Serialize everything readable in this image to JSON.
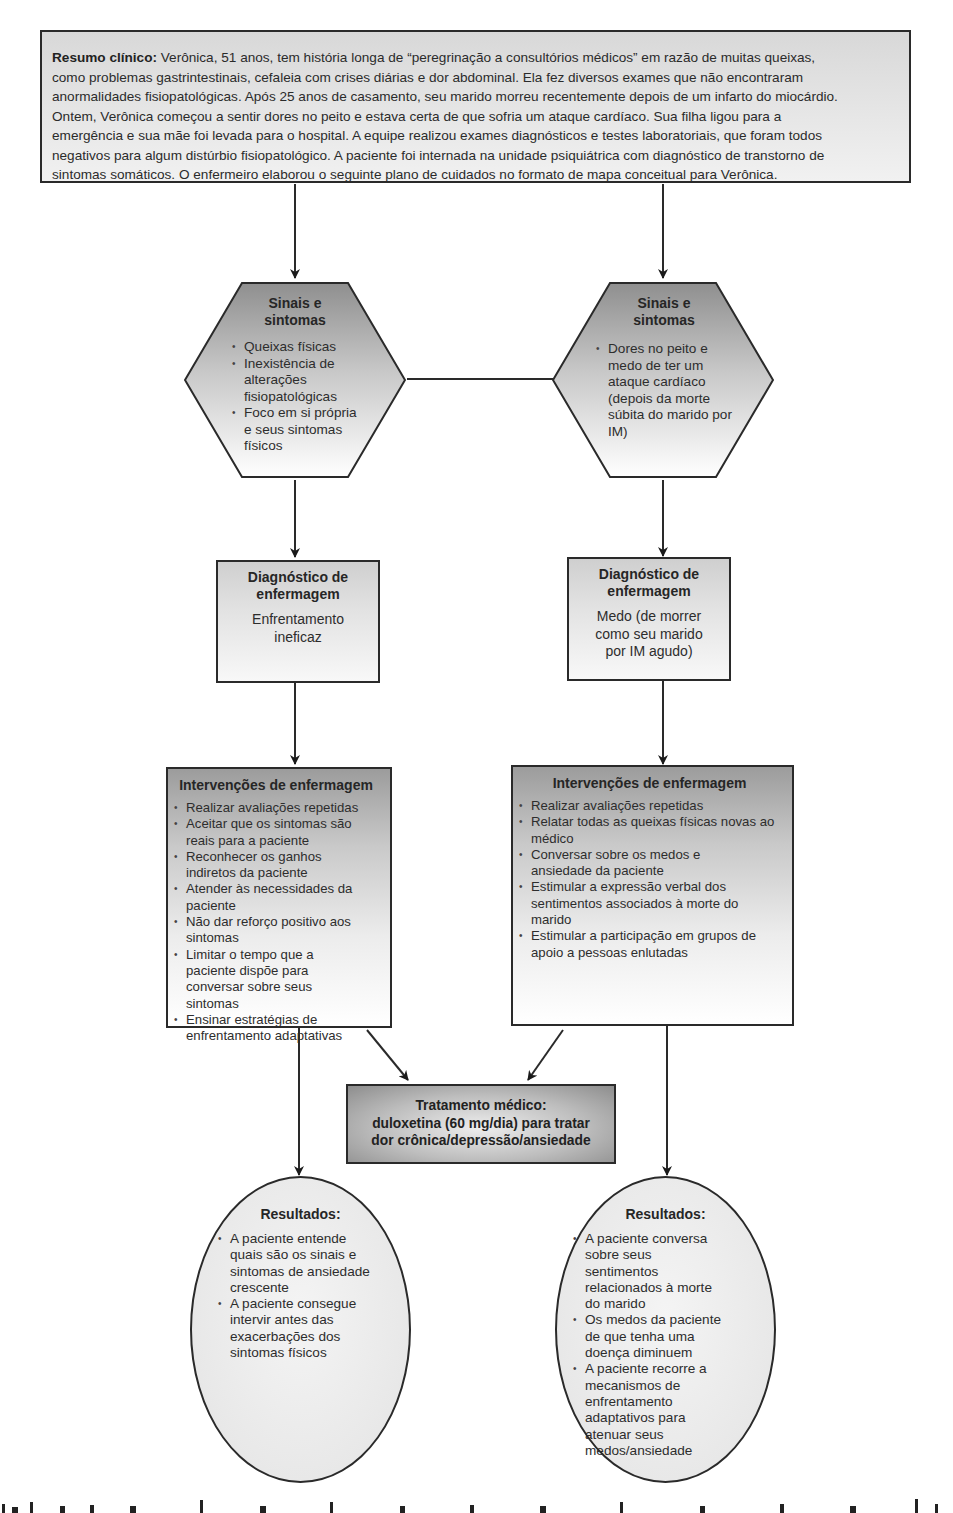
{
  "summary": {
    "label": "Resumo clínico:",
    "lines": [
      " Verônica, 51 anos, tem história longa de “peregrinação a consultórios médicos” em razão de muitas queixas,",
      "como problemas gastrintestinais, cefaleia com crises diárias e dor abdominal. Ela fez diversos exames que não encontraram",
      "anormalidades fisiopatológicas. Após 25 anos de casamento, seu marido morreu recentemente depois de um infarto do miocárdio.",
      "Ontem, Verônica começou a sentir dores no peito e estava certa de que sofria um ataque cardíaco. Sua filha ligou para a",
      "emergência e sua mãe foi levada para o hospital. A equipe realizou exames diagnósticos e testes laboratoriais, que foram todos",
      "negativos para algum distúrbio fisiopatológico. A paciente foi internada na unidade psiquiátrica com diagnóstico de transtorno de",
      "sintomas somáticos. O enfermeiro elaborou o seguinte plano de cuidados no formato de mapa conceitual para Verônica."
    ]
  },
  "left": {
    "signs": {
      "title_lines": [
        "Sinais e",
        "sintomas"
      ],
      "items": [
        "Queixas físicas",
        "Inexistência de alterações fisiopatológicas",
        "Foco em si própria e seus sintomas físicos"
      ]
    },
    "diagnosis": {
      "title_lines": [
        "Diagnóstico de",
        "enfermagem"
      ],
      "body_lines": [
        "Enfrentamento",
        "ineficaz"
      ]
    },
    "interventions": {
      "title": "Intervenções de enfermagem",
      "items": [
        "Realizar avaliações repetidas",
        "Aceitar que os sintomas são reais para a paciente",
        "Reconhecer os ganhos indiretos da paciente",
        "Atender às necessidades da paciente",
        "Não dar reforço positivo aos sintomas",
        "Limitar o tempo que a paciente dispõe para conversar sobre seus sintomas",
        "Ensinar estratégias de enfrentamento adaptativas"
      ]
    },
    "outcomes": {
      "title": "Resultados:",
      "items": [
        "A paciente entende quais são os sinais e sintomas de ansiedade crescente",
        "A paciente consegue intervir antes das exacerbações dos sintomas físicos"
      ]
    }
  },
  "right": {
    "signs": {
      "title_lines": [
        "Sinais e",
        "sintomas"
      ],
      "items": [
        "Dores no peito e medo de ter um ataque cardíaco (depois da morte súbita do marido por IM)"
      ]
    },
    "diagnosis": {
      "title_lines": [
        "Diagnóstico de",
        "enfermagem"
      ],
      "body_lines": [
        "Medo (de morrer",
        "como seu marido",
        "por IM agudo)"
      ]
    },
    "interventions": {
      "title": "Intervenções de enfermagem",
      "items": [
        "Realizar avaliações repetidas",
        "Relatar todas as queixas físicas novas ao médico",
        "Conversar sobre os medos e ansiedade da paciente",
        "Estimular a expressão verbal dos sentimentos associados à morte do marido",
        "Estimular a participação em grupos de apoio a pessoas enlutadas"
      ]
    },
    "outcomes": {
      "title": "Resultados:",
      "items": [
        "A paciente conversa sobre seus sentimentos relacionados à morte do marido",
        "Os medos da paciente de que tenha uma doença diminuem",
        "A paciente recorre a mecanismos de enfrentamento adaptativos para atenuar seus medos/ansiedade"
      ]
    }
  },
  "treatment": {
    "lines": [
      "Tratamento médico:",
      "duloxetina (60 mg/dia) para tratar",
      "dor crônica/depressão/ansiedade"
    ]
  }
}
